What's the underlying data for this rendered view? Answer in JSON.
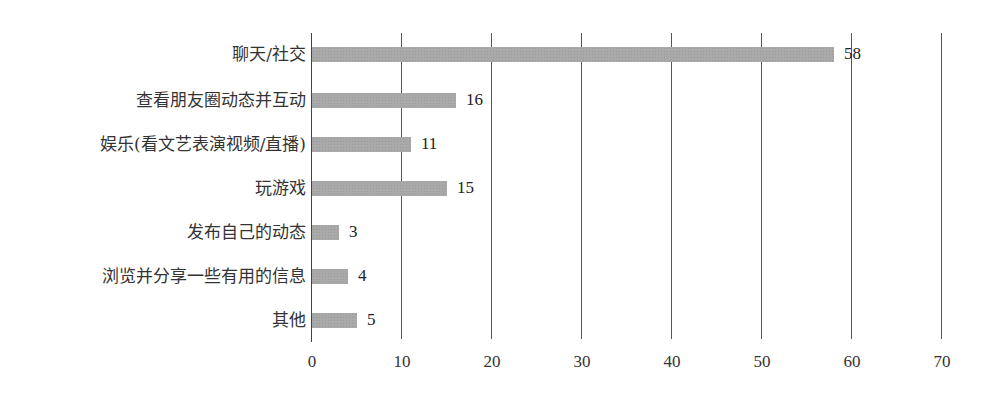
{
  "chart_data": {
    "type": "bar",
    "orientation": "horizontal",
    "title": "",
    "xlabel": "",
    "ylabel": "",
    "categories": [
      "聊天/社交",
      "查看朋友圈动态并互动",
      "娱乐(看文艺表演视频/直播)",
      "玩游戏",
      "发布自己的动态",
      "浏览并分享一些有用的信息",
      "其他"
    ],
    "values": [
      58,
      16,
      11,
      15,
      3,
      4,
      5
    ],
    "value_labels": [
      "58",
      "16",
      "11",
      "15",
      "3",
      "4",
      "5"
    ],
    "xlim": [
      0,
      70
    ],
    "x_ticks": [
      0,
      10,
      20,
      30,
      40,
      50,
      60,
      70
    ],
    "x_tick_labels": [
      "0",
      "10",
      "20",
      "30",
      "40",
      "50",
      "60",
      "70"
    ],
    "grid": "vertical",
    "legend": null,
    "bar_color": "#a9a9a9"
  }
}
